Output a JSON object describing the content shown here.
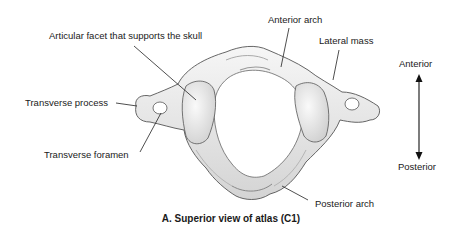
{
  "figure": {
    "caption": "A. Superior view of atlas (C1)",
    "labels": {
      "articular_facet": "Articular facet that supports the skull",
      "anterior_arch": "Anterior arch",
      "lateral_mass": "Lateral mass",
      "transverse_process": "Transverse process",
      "transverse_foramen": "Transverse foramen",
      "posterior_arch": "Posterior arch"
    },
    "orientation": {
      "top": "Anterior",
      "bottom": "Posterior",
      "arrow": "double-headed-vertical-arrow"
    }
  },
  "colors": {
    "bone_fill": "#ececec",
    "bone_shade": "#c9c9c9",
    "outline": "#555555",
    "leader_line": "#222222",
    "text": "#1a1a1a"
  }
}
